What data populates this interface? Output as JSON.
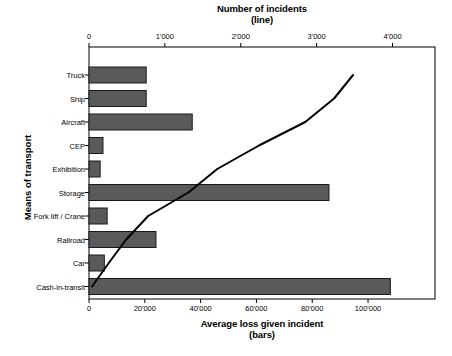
{
  "chart_data": {
    "type": "bar",
    "orientation": "horizontal",
    "title": "",
    "categories": [
      "Truck",
      "Ship",
      "Aircraft",
      "CEP",
      "Exhibition",
      "Storage",
      "Fork lift / Crane",
      "Railroad",
      "Car",
      "Cash-in-transit"
    ],
    "ylabel": "Means of transport",
    "bars": {
      "name": "Average loss given incident",
      "axis": "bottom",
      "xlabel": "Average loss given incident\n(bars)",
      "xlabel_line1": "Average loss given incident",
      "xlabel_line2": "(bars)",
      "values": [
        20500,
        20500,
        37000,
        5000,
        4000,
        86000,
        6500,
        24000,
        5500,
        108000
      ],
      "tick_values": [
        0,
        20000,
        40000,
        60000,
        80000,
        100000
      ],
      "tick_labels": [
        "0",
        "20'000",
        "40'000",
        "60'000",
        "80'000",
        "100'000"
      ],
      "xlim": [
        0,
        124000
      ],
      "color": "#5a5a5a",
      "edge_color": "#1a1a1a"
    },
    "line": {
      "name": "Number of incidents",
      "axis": "top",
      "xlabel": "Number of incidents\n(line)",
      "xlabel_line1": "Number of incidents",
      "xlabel_line2": "(line)",
      "values": [
        3480,
        3230,
        2850,
        2240,
        1690,
        1310,
        780,
        490,
        260,
        40
      ],
      "tick_values": [
        0,
        1000,
        2000,
        3000,
        4000
      ],
      "tick_labels": [
        "0",
        "1'000",
        "2'000",
        "3'000",
        "4'000"
      ],
      "xlim": [
        0,
        4560
      ],
      "color": "#000000"
    },
    "grid": false,
    "legend": "none",
    "plot_frame": true
  },
  "plot_geometry": {
    "left": 89,
    "right": 435,
    "top": 47,
    "bottom": 299,
    "row_first_center": 75,
    "row_spacing": 23.5,
    "bar_height": 16
  }
}
